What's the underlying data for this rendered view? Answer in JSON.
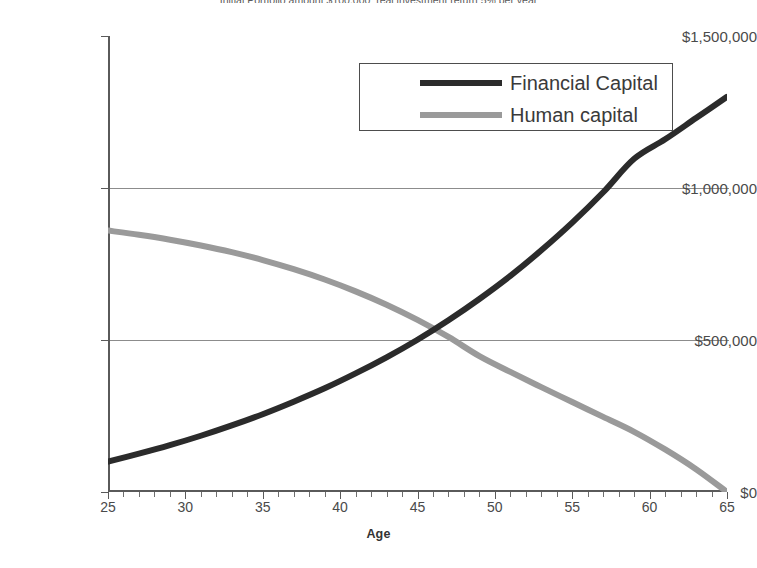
{
  "chart_data": {
    "type": "line",
    "title": "Initial Portfolio amount $100,000; real investment return 5% per year",
    "xlabel": "Age",
    "ylabel": "",
    "xlim": [
      25,
      65
    ],
    "ylim": [
      0,
      1500000
    ],
    "grid": true,
    "legend_position": "top-center",
    "x": [
      25,
      30,
      35,
      40,
      45,
      50,
      55,
      60,
      65
    ],
    "xtick_labels": [
      "25",
      "30",
      "35",
      "40",
      "45",
      "50",
      "55",
      "60",
      "65"
    ],
    "ytick_labels": [
      "$0",
      "$500,000",
      "$1,000,000",
      "$1,500,000"
    ],
    "ytick_values": [
      0,
      500000,
      1000000,
      1500000
    ],
    "series": [
      {
        "name": "Financial Capital",
        "color": "#2b2b2b",
        "x": [
          25,
          27,
          29,
          31,
          33,
          35,
          37,
          39,
          41,
          43,
          45,
          47,
          49,
          51,
          53,
          55,
          57,
          59,
          61,
          63,
          65
        ],
        "values": [
          100000,
          126000,
          154000,
          185000,
          219000,
          256000,
          297000,
          341000,
          390000,
          443000,
          501000,
          565000,
          635000,
          711000,
          795000,
          886000,
          986000,
          1096000,
          1160000,
          1230000,
          1300000
        ]
      },
      {
        "name": "Human capital",
        "color": "#9a9a9a",
        "x": [
          25,
          27,
          29,
          31,
          33,
          35,
          37,
          39,
          41,
          43,
          45,
          47,
          49,
          51,
          53,
          55,
          57,
          59,
          61,
          63,
          65
        ],
        "values": [
          860000,
          846000,
          830000,
          811000,
          789000,
          763000,
          733000,
          699000,
          660000,
          616000,
          566000,
          510000,
          447000,
          395000,
          345000,
          296000,
          247000,
          198000,
          140000,
          75000,
          0
        ]
      }
    ],
    "annotations": {
      "crossover_age": 49,
      "crossover_value": 520000
    }
  },
  "legend": {
    "items": [
      {
        "label": "Financial Capital",
        "swatch": "financial"
      },
      {
        "label": "Human capital",
        "swatch": "human"
      }
    ]
  }
}
